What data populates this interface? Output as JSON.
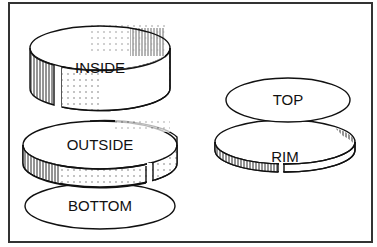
{
  "diagram": {
    "type": "exploded-view",
    "left_assembly": {
      "parts": [
        {
          "id": "inside",
          "label": "INSIDE",
          "shape": "split-ring band (tall)"
        },
        {
          "id": "outside",
          "label": "OUTSIDE",
          "shape": "split-ring band"
        },
        {
          "id": "bottom",
          "label": "BOTTOM",
          "shape": "ellipse disc"
        }
      ]
    },
    "right_assembly": {
      "parts": [
        {
          "id": "top",
          "label": "TOP",
          "shape": "ellipse disc"
        },
        {
          "id": "rim",
          "label": "RIM",
          "shape": "split-ring band (short)"
        }
      ]
    },
    "colors": {
      "line": "#111111",
      "background": "#ffffff",
      "frame": "#333333"
    }
  }
}
